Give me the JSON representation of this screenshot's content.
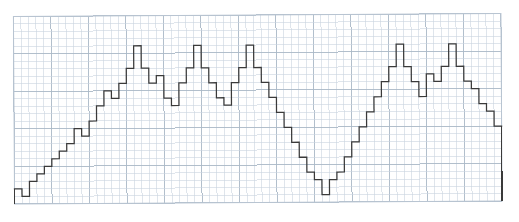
{
  "figure": {
    "kind": "step-plot-on-graph-paper",
    "width": 519,
    "height": 222,
    "background_color": "#ffffff",
    "title": "",
    "subtitle": "",
    "caption": ""
  },
  "grid": {
    "name": "graph-paper-grid",
    "origin_x": 14,
    "origin_y": 15,
    "cell_px": 7.5,
    "cols": 65,
    "rows": 25,
    "minor_color": "#c9d4e0",
    "major_color": "#aab8c6",
    "border_color": "#b9c5d2",
    "major_every": 5,
    "minor_line_width": 0.6,
    "major_line_width": 0.9,
    "show_grid": true,
    "rotation_deg": -0.35
  },
  "trace": {
    "name": "step-trace",
    "stroke_color": "#3a3a3a",
    "stroke_width": 1.25,
    "fill": "none",
    "line_join": "miter",
    "step_mode": "post"
  },
  "chart_data": {
    "type": "bar",
    "render_style": "step-outline",
    "title": "",
    "xlabel": "",
    "ylabel": "",
    "xlim": [
      0,
      65
    ],
    "ylim": [
      0,
      25
    ],
    "grid": true,
    "legend": null,
    "units_per_cell": 1,
    "categories": [
      0,
      1,
      2,
      3,
      4,
      5,
      6,
      7,
      8,
      9,
      10,
      11,
      12,
      13,
      14,
      15,
      16,
      17,
      18,
      19,
      20,
      21,
      22,
      23,
      24,
      25,
      26,
      27,
      28,
      29,
      30,
      31,
      32,
      33,
      34,
      35,
      36,
      37,
      38,
      39,
      40,
      41,
      42,
      43,
      44,
      45,
      46,
      47,
      48,
      49,
      50,
      51,
      52,
      53,
      54,
      55,
      56,
      57,
      58,
      59,
      60,
      61,
      62,
      63,
      64
    ],
    "values": [
      2,
      1,
      3,
      4,
      5,
      6,
      7,
      8,
      10,
      9,
      11,
      13,
      15,
      14,
      16,
      18,
      21,
      18,
      16,
      17,
      14,
      13,
      16,
      18,
      21,
      18,
      16,
      14,
      13,
      16,
      18,
      21,
      18,
      16,
      14,
      12,
      10,
      8,
      6,
      4,
      3,
      1,
      3,
      4,
      6,
      8,
      10,
      12,
      14,
      16,
      18,
      21,
      18,
      16,
      14,
      17,
      16,
      18,
      21,
      18,
      16,
      15,
      13,
      12,
      10
    ],
    "series": [
      {
        "name": "modulated-step-signal",
        "values": [
          2,
          1,
          3,
          4,
          5,
          6,
          7,
          8,
          10,
          9,
          11,
          13,
          15,
          14,
          16,
          18,
          21,
          18,
          16,
          17,
          14,
          13,
          16,
          18,
          21,
          18,
          16,
          14,
          13,
          16,
          18,
          21,
          18,
          16,
          14,
          12,
          10,
          8,
          6,
          4,
          3,
          1,
          3,
          4,
          6,
          8,
          10,
          12,
          14,
          16,
          18,
          21,
          18,
          16,
          14,
          17,
          16,
          18,
          21,
          18,
          16,
          15,
          13,
          12,
          10
        ]
      }
    ],
    "annotations": [],
    "peaks": [
      16,
      24,
      31,
      51,
      58
    ],
    "valleys": [
      1,
      41
    ]
  }
}
